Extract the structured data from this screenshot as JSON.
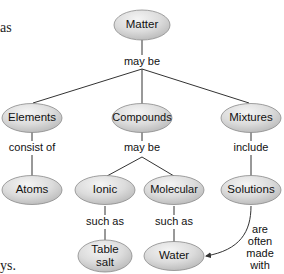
{
  "side_text": {
    "top_fragment": "as",
    "bottom_fragment": "ys."
  },
  "colors": {
    "node_fill_light": "#f2f2f2",
    "node_fill_dark": "#bdbdbd",
    "node_stroke": "#8a8a8a",
    "edge": "#333333"
  },
  "nodes": {
    "matter": {
      "label": "Matter"
    },
    "elements": {
      "label": "Elements"
    },
    "compounds": {
      "label": "Compounds"
    },
    "mixtures": {
      "label": "Mixtures"
    },
    "atoms": {
      "label": "Atoms"
    },
    "ionic": {
      "label": "Ionic"
    },
    "molecular": {
      "label": "Molecular"
    },
    "solutions": {
      "label": "Solutions"
    },
    "table_salt": {
      "line1": "Table",
      "line2": "salt"
    },
    "water": {
      "label": "Water"
    }
  },
  "links": {
    "matter_may_be": "may be",
    "elements_consist_of": "consist of",
    "compounds_may_be": "may be",
    "mixtures_include": "include",
    "ionic_such_as": "such as",
    "molecular_such_as": "such as",
    "solutions_water": {
      "line1": "are",
      "line2": "often",
      "line3": "made",
      "line4": "with"
    }
  }
}
